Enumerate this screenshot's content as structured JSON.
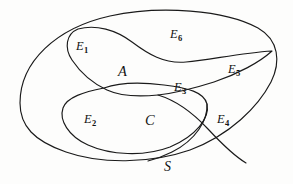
{
  "figure": {
    "kind": "set-diagram",
    "title_text": "",
    "background_color": "#fdfdfc",
    "line_color": "#1a1a1a",
    "text_color": "#131313"
  },
  "labels": {
    "universe": {
      "text": "S",
      "x": 164,
      "y": 160
    },
    "set_a": {
      "text": "A",
      "x": 118,
      "y": 64
    },
    "set_c": {
      "text": "C",
      "x": 145,
      "y": 113
    },
    "events": [
      {
        "base": "E",
        "sub": "1",
        "x": 76,
        "y": 40
      },
      {
        "base": "E",
        "sub": "2",
        "x": 84,
        "y": 113
      },
      {
        "base": "E",
        "sub": "3",
        "x": 174,
        "y": 81
      },
      {
        "base": "E",
        "sub": "4",
        "x": 217,
        "y": 113
      },
      {
        "base": "E",
        "sub": "5",
        "x": 228,
        "y": 63
      },
      {
        "base": "E",
        "sub": "6",
        "x": 170,
        "y": 28
      }
    ]
  },
  "curves": {
    "universe_outline": "M 20 103 C 20 62 56 28 110 16 C 160 5 225 10 258 28 C 279 40 281 62 271 82 C 258 107 230 135 190 150 C 150 164 100 164 66 152 C 34 141 20 126 20 103 Z",
    "set_a_outline": "M 78 29 C 96 24 116 30 132 42 C 148 54 164 64 186 62 C 210 60 240 53 272 51 C 260 62 238 74 214 82 C 192 89 176 93 158 95 C 138 97 120 96 107 90 C 92 83 80 72 72 60 C 64 48 66 34 78 29 Z",
    "set_c_outline": "M 104 88 C 118 83 140 82 164 85 C 188 88 204 92 207 104 C 210 118 196 136 170 147 C 144 157 110 155 88 145 C 68 136 59 120 63 108 C 67 97 84 92 104 88 Z",
    "a_lower_tail": "M 158 95 C 178 101 194 114 208 129 C 222 144 236 157 246 163",
    "c_right_tail": "M 207 104 C 208 120 196 140 172 152 C 160 158 152 160 148 161"
  }
}
